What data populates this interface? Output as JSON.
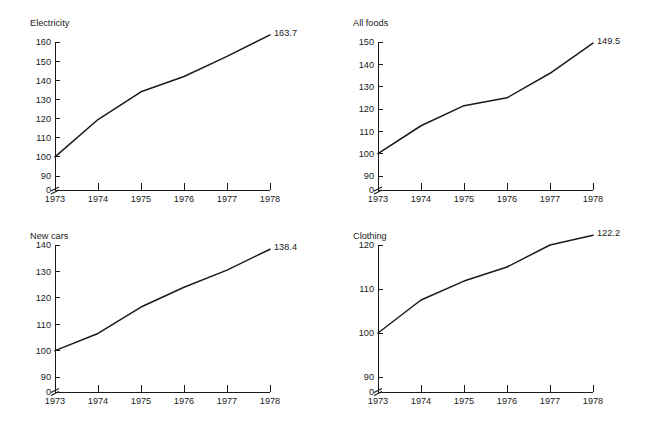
{
  "figure": {
    "background_color": "#ffffff",
    "line_color": "#1a1a1a",
    "text_color": "#1a1a1a",
    "panel_count": 4
  },
  "chart_data": [
    {
      "type": "line",
      "title": "Electricity",
      "panel": "top-left",
      "xlabel": "",
      "ylabel": "",
      "x": [
        1973,
        1974,
        1975,
        1976,
        1977,
        1978
      ],
      "xtick_labels": [
        "1973",
        "1974",
        "1975",
        "1976",
        "1977",
        "1978"
      ],
      "values": [
        100.0,
        119.5,
        134.0,
        142.0,
        152.5,
        163.7
      ],
      "ytick_labels": [
        "0",
        "90",
        "100",
        "110",
        "120",
        "130",
        "140",
        "150",
        "160"
      ],
      "yticks": [
        0,
        90,
        100,
        110,
        120,
        130,
        140,
        150,
        160
      ],
      "ylim": [
        90,
        160
      ],
      "axis_break": true,
      "grid": false,
      "legend": "none",
      "end_label": "163.7"
    },
    {
      "type": "line",
      "title": "All foods",
      "panel": "top-right",
      "xlabel": "",
      "ylabel": "",
      "x": [
        1973,
        1974,
        1975,
        1976,
        1977,
        1978
      ],
      "xtick_labels": [
        "1973",
        "1974",
        "1975",
        "1976",
        "1977",
        "1978"
      ],
      "values": [
        100.0,
        112.5,
        121.5,
        125.0,
        136.0,
        149.5
      ],
      "ytick_labels": [
        "0",
        "90",
        "100",
        "110",
        "120",
        "130",
        "140",
        "150"
      ],
      "yticks": [
        0,
        90,
        100,
        110,
        120,
        130,
        140,
        150
      ],
      "ylim": [
        90,
        150
      ],
      "axis_break": true,
      "grid": false,
      "legend": "none",
      "end_label": "149.5"
    },
    {
      "type": "line",
      "title": "New cars",
      "panel": "bottom-left",
      "xlabel": "",
      "ylabel": "",
      "x": [
        1973,
        1974,
        1975,
        1976,
        1977,
        1978
      ],
      "xtick_labels": [
        "1973",
        "1974",
        "1975",
        "1976",
        "1977",
        "1978"
      ],
      "values": [
        100.0,
        106.5,
        116.5,
        124.0,
        130.5,
        138.4
      ],
      "ytick_labels": [
        "0",
        "90",
        "100",
        "110",
        "120",
        "130",
        "140"
      ],
      "yticks": [
        0,
        90,
        100,
        110,
        120,
        130,
        140
      ],
      "ylim": [
        90,
        140
      ],
      "axis_break": true,
      "grid": false,
      "legend": "none",
      "end_label": "138.4"
    },
    {
      "type": "line",
      "title": "Clothing",
      "panel": "bottom-right",
      "xlabel": "",
      "ylabel": "",
      "x": [
        1973,
        1974,
        1975,
        1976,
        1977,
        1978
      ],
      "xtick_labels": [
        "1973",
        "1974",
        "1975",
        "1976",
        "1977",
        "1978"
      ],
      "values": [
        100.0,
        107.5,
        111.8,
        115.0,
        120.0,
        122.2
      ],
      "ytick_labels": [
        "0",
        "90",
        "100",
        "110",
        "120"
      ],
      "yticks": [
        0,
        90,
        100,
        110,
        120
      ],
      "ylim": [
        90,
        122.8
      ],
      "axis_break": true,
      "grid": false,
      "legend": "none",
      "end_label": "122.2"
    }
  ]
}
